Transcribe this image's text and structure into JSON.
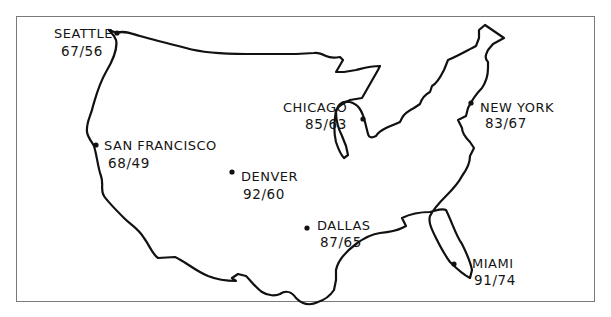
{
  "map": {
    "title": "",
    "colors": {
      "outline": "#111111",
      "frame": "#7a7a7a",
      "background": "#ffffff"
    },
    "cities": [
      {
        "name": "SEATTLE",
        "temps": "67/56",
        "high": 67,
        "low": 56
      },
      {
        "name": "SAN FRANCISCO",
        "temps": "68/49",
        "high": 68,
        "low": 49
      },
      {
        "name": "DENVER",
        "temps": "92/60",
        "high": 92,
        "low": 60
      },
      {
        "name": "CHICAGO",
        "temps": "85/63",
        "high": 85,
        "low": 63
      },
      {
        "name": "NEW YORK",
        "temps": "83/67",
        "high": 83,
        "low": 67
      },
      {
        "name": "DALLAS",
        "temps": "87/65",
        "high": 87,
        "low": 65
      },
      {
        "name": "MIAMI",
        "temps": "91/74",
        "high": 91,
        "low": 74
      }
    ]
  }
}
